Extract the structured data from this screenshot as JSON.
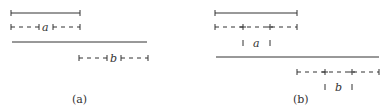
{
  "panels": [
    {
      "caption": "(a)",
      "segments": {
        "top": "solid",
        "bottom": "solid"
      },
      "interval_labels": [
        "a",
        "b"
      ]
    },
    {
      "caption": "(b)",
      "segments": {
        "top": "solid",
        "bottom": "solid"
      },
      "interval_labels": [
        "a",
        "b"
      ]
    }
  ],
  "colors": {
    "stroke": "#333333",
    "background": "#ffffff"
  }
}
